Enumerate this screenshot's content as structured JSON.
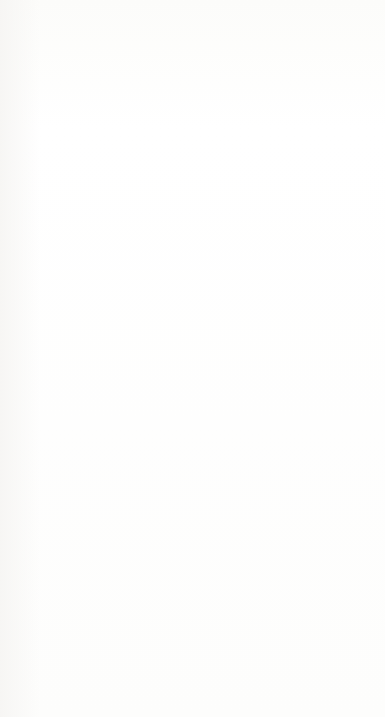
{
  "diagram": {
    "type": "flowchart",
    "orientation": "rotated-90-ccw",
    "title": "",
    "nodes": [
      {
        "id": "get-support-response",
        "label": "Get support\nresponse and/or\noptions.",
        "col": 2,
        "row": 1
      },
      {
        "id": "arrange-support-visit",
        "label": "Arrange for\nand/or receive a\nsupport visit.",
        "col": 1,
        "row": 2
      },
      {
        "id": "explain-question",
        "label": "Explain the\nquestion or\nproblem.",
        "col": 2,
        "row": 2
      },
      {
        "id": "execute-instructions",
        "label": "Execute support\ninstructions.",
        "col": 3,
        "row": 2
      },
      {
        "id": "gather-inputs",
        "label": "Gather\nnecessary\nsupport inputs.",
        "col": 1,
        "row": 3
      },
      {
        "id": "contact-support",
        "label": "Contact\nsupport.",
        "col": 2,
        "row": 3
      },
      {
        "id": "evaluate-response",
        "label": "Evaluate support\nresponse and/or\nresults.",
        "col": 3,
        "row": 3
      },
      {
        "id": "determine-actions",
        "label": "Determine what\nactions to take\nprior to contact-\ning support.",
        "col": 1,
        "row": 4
      },
      {
        "id": "determine-how",
        "label": "Determine how\nto contact\nsupport.",
        "col": 2,
        "row": 4
      },
      {
        "id": "recontact-support",
        "label": "Recontact\nsupport.",
        "col": 3,
        "row": 4
      },
      {
        "id": "determine-if",
        "label": "Determine if\nsupport should\nbe contacted.",
        "col": 2,
        "row": 5
      },
      {
        "id": "address-future",
        "label": "Address future\nproblems.",
        "col": 3,
        "row": 5
      }
    ],
    "edges": [
      {
        "from": "determine-if",
        "to": "determine-how",
        "kind": "arrow"
      },
      {
        "from": "determine-actions",
        "to": "determine-how",
        "kind": "double-arrow"
      },
      {
        "from": "determine-actions",
        "to": "gather-inputs",
        "kind": "arrow"
      },
      {
        "from": "determine-how",
        "to": "contact-support",
        "kind": "arrow"
      },
      {
        "from": "gather-inputs",
        "to": "contact-support",
        "kind": "arrow"
      },
      {
        "from": "contact-support",
        "to": "arrange-support-visit",
        "kind": "arrow"
      },
      {
        "from": "contact-support",
        "to": "explain-question",
        "kind": "arrow"
      },
      {
        "from": "arrange-support-visit",
        "to": "explain-question",
        "kind": "arrow"
      },
      {
        "from": "explain-question",
        "to": "get-support-response",
        "kind": "arrow"
      },
      {
        "from": "get-support-response",
        "to": "arrange-support-visit",
        "kind": "arrow"
      },
      {
        "from": "get-support-response",
        "to": "execute-instructions",
        "kind": "arrow"
      },
      {
        "from": "execute-instructions",
        "to": "evaluate-response",
        "kind": "arrow"
      },
      {
        "from": "evaluate-response",
        "to": "recontact-support",
        "kind": "arrow"
      },
      {
        "from": "evaluate-response",
        "to": "address-future",
        "kind": "arrow"
      },
      {
        "from": "recontact-support",
        "to": "address-future",
        "kind": "arrow"
      }
    ],
    "colors": {
      "box_border": "#58585a",
      "box_fill": "#ffffff",
      "connector": "#1d1d1f",
      "text": "#2d2d2f",
      "page": "#fdfdfc"
    }
  }
}
